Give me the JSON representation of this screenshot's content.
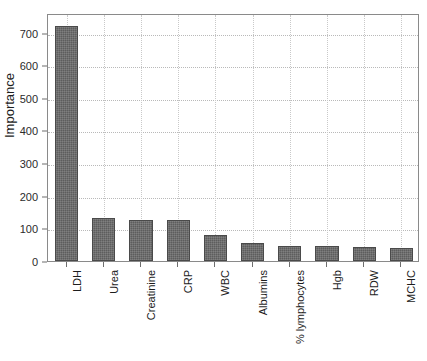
{
  "chart_data": {
    "type": "bar",
    "title": "",
    "subtitle": "",
    "xlabel": "",
    "ylabel": "Importance",
    "categories": [
      "LDH",
      "Urea",
      "Creatinine",
      "CRP",
      "WBC",
      "Albumins",
      "% lymphocytes",
      "Hgb",
      "RDW",
      "MCHC"
    ],
    "values": [
      721,
      131,
      126,
      125,
      79,
      55,
      47,
      47,
      42,
      40
    ],
    "series": [
      {
        "name": "Importance",
        "values": [
          721,
          131,
          126,
          125,
          79,
          55,
          47,
          47,
          42,
          40
        ]
      }
    ],
    "ylim": [
      0,
      760
    ],
    "yticks": [
      0,
      100,
      200,
      300,
      400,
      500,
      600,
      700
    ],
    "ytick_labels": [
      "0",
      "100",
      "200",
      "300",
      "400",
      "500",
      "600",
      "700"
    ],
    "grid": true,
    "grid_style": "dotted",
    "legend": false,
    "legend_position": "none",
    "bar_color": "#5d5d5d",
    "bar_edge_color": "#4a4a4a",
    "grid_color": "#b9b9b9",
    "axis_color": "#8a8a8a",
    "text_color": "#1d1d1d",
    "background_color": "#ffffff"
  }
}
